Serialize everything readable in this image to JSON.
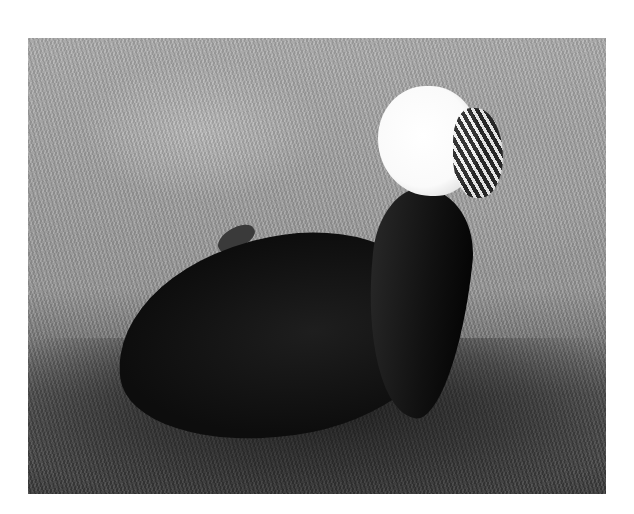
{
  "image": {
    "subject": "Polish chicken with white crest standing on grass",
    "style": "grayscale photograph",
    "colors": {
      "background": "#ffffff",
      "grass_light": "#b0b0b0",
      "grass_shadow": "#3a3a3a",
      "bird_body": "#111111",
      "crest": "#ffffff"
    }
  }
}
